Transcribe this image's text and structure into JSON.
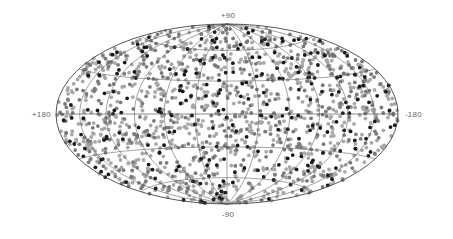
{
  "chart_data": {
    "type": "scatter",
    "projection": "aitoff-hammer all-sky (galactic coordinates)",
    "title": "",
    "axis_labels": {
      "top": "+90",
      "bottom": "-90",
      "left": "+180",
      "right": "-180"
    },
    "grid": true,
    "grid_spec": {
      "longitude_step_deg": 30,
      "latitude_step_deg": 30
    },
    "legend": null,
    "series": [
      {
        "name": "light-gray points",
        "color": "#a8a8a8",
        "approx_count": 900
      },
      {
        "name": "mid-gray points",
        "color": "#7a7a7a",
        "approx_count": 450
      },
      {
        "name": "black points",
        "color": "#1a1a1a",
        "approx_count": 250
      }
    ],
    "distribution": "approximately isotropic across the full sky",
    "ellipse": {
      "cx": 227,
      "cy": 114,
      "rx": 171,
      "ry": 90
    }
  },
  "labels": {
    "top": "+90",
    "bottom": "-90",
    "left": "+180",
    "right": "-180"
  },
  "colors": {
    "grid": "#555555",
    "outline": "#444444",
    "background": "#ffffff"
  }
}
